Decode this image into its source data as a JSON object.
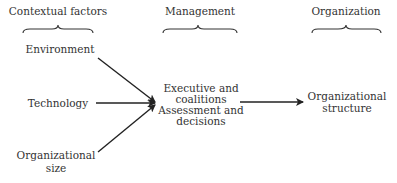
{
  "headers": {
    "contextual": "Contextual factors",
    "management": "Management",
    "organization": "Organization"
  },
  "nodes": {
    "environment": "Environment",
    "technology": "Technology",
    "org_size_line1": "Organizational",
    "org_size_line2": "size",
    "mgmt_line1": "Executive and",
    "mgmt_line2": "coalitions",
    "mgmt_line3": "Assessment and",
    "mgmt_line4": "decisions",
    "org_struct_line1": "Organizational",
    "org_struct_line2": "structure"
  },
  "edges": [
    {
      "from": "Environment",
      "to": "Management"
    },
    {
      "from": "Technology",
      "to": "Management"
    },
    {
      "from": "Organizational size",
      "to": "Management"
    },
    {
      "from": "Management",
      "to": "Organizational structure"
    }
  ]
}
